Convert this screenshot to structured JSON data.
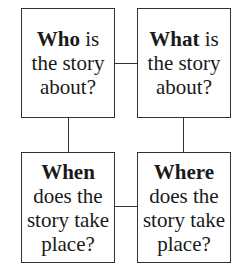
{
  "boxes": {
    "who": {
      "bold": "Who",
      "rest_line1": " is",
      "line2": "the story",
      "line3": "about?"
    },
    "what": {
      "bold": "What",
      "rest_line1": " is",
      "line2": "the story",
      "line3": "about?"
    },
    "when": {
      "bold": "When",
      "line2": "does the",
      "line3": "story take",
      "line4": "place?"
    },
    "where": {
      "bold": "Where",
      "line2": "does the",
      "line3": "story take",
      "line4": "place?"
    }
  },
  "colors": {
    "line": "#333333",
    "text": "#1a1a1a",
    "background": "#ffffff"
  }
}
